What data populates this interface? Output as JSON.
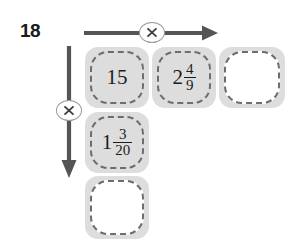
{
  "problem": {
    "number": "18"
  },
  "operators": {
    "horizontal": {
      "symbol": "×",
      "icon": "multiply-icon",
      "direction": "right"
    },
    "vertical": {
      "symbol": "×",
      "icon": "multiply-icon",
      "direction": "down"
    }
  },
  "colors": {
    "box_fill": "#dddddd",
    "box_border": "#6d6d6d",
    "arrow": "#555555",
    "text": "#1c1c1c",
    "background": "#ffffff"
  },
  "grid": {
    "cells": [
      {
        "id": "cell-r1c1",
        "filled": true,
        "whole": "15",
        "numerator": "",
        "denominator": "",
        "display": "15"
      },
      {
        "id": "cell-r1c2",
        "filled": true,
        "whole": "2",
        "numerator": "4",
        "denominator": "9",
        "display": "2 4/9"
      },
      {
        "id": "cell-r1c3",
        "filled": false,
        "whole": "",
        "numerator": "",
        "denominator": "",
        "display": ""
      },
      {
        "id": "cell-r2c1",
        "filled": true,
        "whole": "1",
        "numerator": "3",
        "denominator": "20",
        "display": "1 3/20"
      },
      {
        "id": "cell-r3c1",
        "filled": false,
        "whole": "",
        "numerator": "",
        "denominator": "",
        "display": ""
      }
    ]
  }
}
